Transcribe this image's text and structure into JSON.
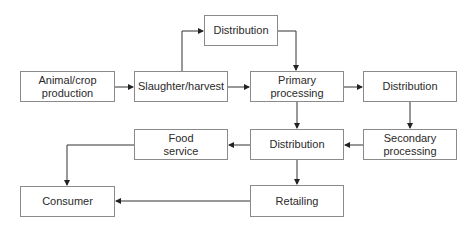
{
  "diagram": {
    "type": "flowchart",
    "nodes": {
      "animal_crop": "Animal/crop\nproduction",
      "slaughter": "Slaughter/harvest",
      "distribution_top": "Distribution",
      "primary": "Primary\nprocessing",
      "distribution_right": "Distribution",
      "food_service": "Food\nservice",
      "distribution_mid": "Distribution",
      "secondary": "Secondary\nprocessing",
      "consumer": "Consumer",
      "retailing": "Retailing"
    },
    "edges": [
      [
        "Animal/crop production",
        "Slaughter/harvest"
      ],
      [
        "Slaughter/harvest",
        "Distribution (top)"
      ],
      [
        "Distribution (top)",
        "Primary processing"
      ],
      [
        "Slaughter/harvest",
        "Primary processing"
      ],
      [
        "Primary processing",
        "Distribution (right)"
      ],
      [
        "Distribution (right)",
        "Secondary processing"
      ],
      [
        "Primary processing",
        "Distribution (mid)"
      ],
      [
        "Secondary processing",
        "Distribution (mid)"
      ],
      [
        "Distribution (mid)",
        "Food service"
      ],
      [
        "Distribution (mid)",
        "Retailing"
      ],
      [
        "Food service",
        "Consumer"
      ],
      [
        "Retailing",
        "Consumer"
      ]
    ],
    "colors": {
      "line": "#222222",
      "border": "#8a8a8a",
      "text": "#2a2a2a"
    }
  }
}
